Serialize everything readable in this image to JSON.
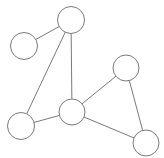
{
  "figure": {
    "kind": "node-link-graph-diagram",
    "title": "",
    "background_color": "#ffffff",
    "width": 164,
    "height": 158
  },
  "style": {
    "node_fill": "#ffffff",
    "node_stroke": "#7a7a7a",
    "node_stroke_width": 1,
    "edge_stroke": "#7a7a7a",
    "edge_stroke_width": 1
  },
  "graph": {
    "node_count": 6,
    "edge_count": 7,
    "nodes": [
      {
        "id": "n1",
        "label": "",
        "cx": 24,
        "cy": 46,
        "r": 13.5,
        "position_name": "upper-left-small"
      },
      {
        "id": "n2",
        "label": "",
        "cx": 71,
        "cy": 20,
        "r": 13.5,
        "position_name": "top"
      },
      {
        "id": "n3",
        "label": "",
        "cx": 21,
        "cy": 126,
        "r": 13.5,
        "position_name": "bottom-left"
      },
      {
        "id": "n4",
        "label": "",
        "cx": 72,
        "cy": 112,
        "r": 13.0,
        "position_name": "center"
      },
      {
        "id": "n5",
        "label": "",
        "cx": 126,
        "cy": 68,
        "r": 13.0,
        "position_name": "right-upper"
      },
      {
        "id": "n6",
        "label": "",
        "cx": 146,
        "cy": 143,
        "r": 13.0,
        "position_name": "bottom-right"
      }
    ],
    "edges": [
      {
        "id": "e1",
        "source": "n2",
        "target": "n1",
        "label": ""
      },
      {
        "id": "e2",
        "source": "n2",
        "target": "n3",
        "label": ""
      },
      {
        "id": "e3",
        "source": "n2",
        "target": "n4",
        "label": ""
      },
      {
        "id": "e4",
        "source": "n3",
        "target": "n4",
        "label": ""
      },
      {
        "id": "e5",
        "source": "n4",
        "target": "n5",
        "label": ""
      },
      {
        "id": "e6",
        "source": "n4",
        "target": "n6",
        "label": ""
      },
      {
        "id": "e7",
        "source": "n5",
        "target": "n6",
        "label": ""
      }
    ]
  }
}
